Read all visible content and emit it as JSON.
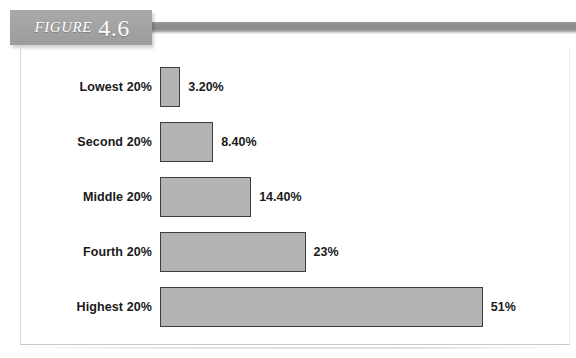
{
  "figure": {
    "label_word": "FIGURE",
    "number": "4.6"
  },
  "chart_data": {
    "type": "bar",
    "orientation": "horizontal",
    "title": "",
    "xlabel": "",
    "ylabel": "",
    "grid": false,
    "legend": null,
    "xlim": [
      0,
      55
    ],
    "categories": [
      "Lowest 20%",
      "Second 20%",
      "Middle 20%",
      "Fourth 20%",
      "Highest 20%"
    ],
    "values": [
      3.2,
      8.4,
      14.4,
      23,
      51
    ],
    "value_labels": [
      "3.20%",
      "8.40%",
      "14.40%",
      "23%",
      "51%"
    ],
    "bar_fill_color": "#b4b4b4",
    "bar_border_color": "#3d3d3d",
    "bars": [
      {
        "category": "Lowest 20%",
        "value": 3.2,
        "value_label": "3.20%"
      },
      {
        "category": "Second 20%",
        "value": 8.4,
        "value_label": "8.40%"
      },
      {
        "category": "Middle 20%",
        "value": 14.4,
        "value_label": "14.40%"
      },
      {
        "category": "Fourth 20%",
        "value": 23,
        "value_label": "23%"
      },
      {
        "category": "Highest 20%",
        "value": 51,
        "value_label": "51%"
      }
    ]
  }
}
